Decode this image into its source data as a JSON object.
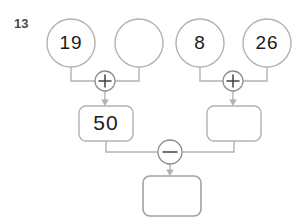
{
  "worksheet": {
    "question_number": "13",
    "type": "number-bond-arithmetic-flow-diagram",
    "colors": {
      "stroke": "#b0b2b4",
      "operator_stroke": "#8b8d8f",
      "text": "#1b1b1b",
      "question_number": "#4a4a4a",
      "background": "#ffffff"
    },
    "top_row_circles": [
      {
        "name": "circle-1",
        "value": "19",
        "empty": false,
        "cx": 71,
        "cy": 43,
        "r": 24
      },
      {
        "name": "circle-2",
        "value": "",
        "empty": true,
        "cx": 139,
        "cy": 43,
        "r": 24
      },
      {
        "name": "circle-3",
        "value": "8",
        "empty": false,
        "cx": 200,
        "cy": 43,
        "r": 24
      },
      {
        "name": "circle-4",
        "value": "26",
        "empty": true,
        "cx": 267,
        "cy": 43,
        "r": 24
      }
    ],
    "operators": [
      {
        "name": "operator-add-left",
        "symbol": "+",
        "label": "plus",
        "cx": 105,
        "cy": 81,
        "r": 10
      },
      {
        "name": "operator-add-right",
        "symbol": "+",
        "label": "plus",
        "cx": 233,
        "cy": 81,
        "r": 10
      },
      {
        "name": "operator-subtract",
        "symbol": "−",
        "label": "minus",
        "cx": 170,
        "cy": 152,
        "r": 12
      }
    ],
    "middle_row_boxes": [
      {
        "name": "box-left-result",
        "value": "50",
        "empty": false,
        "x": 79,
        "y": 106,
        "w": 54,
        "h": 35
      },
      {
        "name": "box-right-result",
        "value": "",
        "empty": true,
        "x": 207,
        "y": 106,
        "w": 54,
        "h": 35
      }
    ],
    "answer_box": {
      "name": "box-final-answer",
      "value": "",
      "empty": true,
      "x": 143,
      "y": 176,
      "w": 58,
      "h": 40
    }
  }
}
